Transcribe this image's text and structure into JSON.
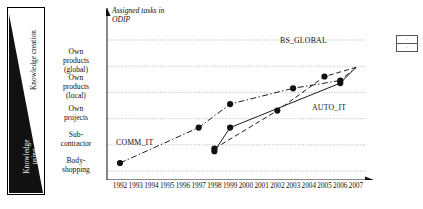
{
  "figure": {
    "annotation": "Assigned tasks in\nODIP",
    "triangle": {
      "top_label": "Knowledge creation",
      "bottom_label": "Knowledge\nusing"
    }
  },
  "chart_data": {
    "type": "line",
    "title": "",
    "xlabel": "",
    "ylabel": "",
    "grid": true,
    "legend_position": "top-right",
    "x": [
      1992,
      1993,
      1994,
      1995,
      1996,
      1997,
      1998,
      1999,
      2000,
      2001,
      2002,
      2003,
      2004,
      2005,
      2006,
      2007
    ],
    "y_categories": [
      "Body-shopping",
      "Sub-contractor",
      "Own projects",
      "Own products (local)",
      "Own products (global)"
    ],
    "y_category_labels": [
      "Own\nproducts\n(global)",
      "Own\nproducts\n(local)",
      "Own\nprojects",
      "Sub-\ncontractor",
      "Body-\nshopping"
    ],
    "series": [
      {
        "name": "COMM_IT",
        "style": "dash-dot",
        "points": [
          {
            "x": 1992,
            "y": 0.0
          },
          {
            "x": 1997,
            "y": 1.35
          },
          {
            "x": 1999,
            "y": 2.25
          },
          {
            "x": 2003,
            "y": 2.85
          },
          {
            "x": 2006,
            "y": 3.15
          },
          {
            "x": 2007,
            "y": 3.65
          }
        ]
      },
      {
        "name": "BS_GLOBAL",
        "style": "dashed",
        "points": [
          {
            "x": 1998,
            "y": 0.55
          },
          {
            "x": 2002,
            "y": 2.0
          },
          {
            "x": 2005,
            "y": 3.3
          },
          {
            "x": 2007,
            "y": 3.65
          }
        ]
      },
      {
        "name": "AUTO_IT",
        "style": "solid",
        "points": [
          {
            "x": 1998,
            "y": 0.45
          },
          {
            "x": 1999,
            "y": 1.35
          },
          {
            "x": 2006,
            "y": 3.05
          },
          {
            "x": 2007,
            "y": 3.65
          }
        ]
      }
    ]
  },
  "xticks": [
    "1992",
    "1993",
    "1994",
    "1995",
    "1996",
    "1997",
    "1998",
    "1999",
    "2000",
    "2001",
    "2002",
    "2003",
    "2004",
    "2005",
    "2006",
    "2007"
  ],
  "legend": {
    "rows": [
      {
        "mark": "–"
      },
      {
        "mark": "–"
      }
    ]
  }
}
